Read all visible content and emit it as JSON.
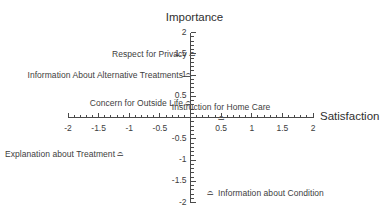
{
  "chart_data": {
    "type": "scatter",
    "title": "",
    "xlabel": "Satisfaction",
    "ylabel": "Importance",
    "xlim": [
      -2,
      2
    ],
    "ylim": [
      -2,
      2
    ],
    "grid": false,
    "legend": "none",
    "axis_style": "crossed-at-origin",
    "xticks": [
      -2,
      -1.5,
      -1,
      -0.5,
      0.5,
      1,
      1.5,
      2
    ],
    "xtick_labels": [
      "-2",
      "-1.5",
      "-1",
      "-0.5",
      "0.5",
      "1",
      "1.5",
      "2"
    ],
    "yticks": [
      2,
      1.5,
      1,
      0.5,
      -0.5,
      -1,
      -1.5,
      -2
    ],
    "ytick_labels": [
      "2",
      "1.5",
      "1",
      "0.5",
      "-0.5",
      "-1",
      "-1.5",
      "-2"
    ],
    "minor_tick_interval": 0.1,
    "marker_glyph": "⌓",
    "points": [
      {
        "label": "Respect for Privacy",
        "x": 0.02,
        "y": 1.5,
        "label_side": "left"
      },
      {
        "label": "Information About Alternative Treatments",
        "x": -0.04,
        "y": 1.0,
        "label_side": "left"
      },
      {
        "label": "Concern for Outside Life",
        "x": -0.04,
        "y": 0.33,
        "label_side": "left"
      },
      {
        "label": "Instruction for Home Care",
        "x": 0.5,
        "y": 0.0,
        "label_side": "above"
      },
      {
        "label": "Explanation about Treatment",
        "x": -1.15,
        "y": -0.85,
        "label_side": "left"
      },
      {
        "label": "Information about Condition",
        "x": 0.32,
        "y": -1.78,
        "label_side": "right"
      }
    ]
  },
  "colors": {
    "axis": "#4a4a4a",
    "text": "#3d3d3d",
    "title": "#2f2f2f",
    "marker": "#575757",
    "background": "#ffffff"
  }
}
